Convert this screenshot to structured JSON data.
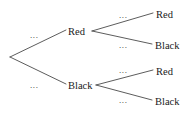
{
  "diagram": {
    "type": "probability-tree",
    "title": "",
    "stroke_color": "#4a4a4a",
    "text_color": "#1a1a1a",
    "background": "#ffffff",
    "root": {
      "label": "",
      "x": 10,
      "y": 57
    },
    "nodes": [
      {
        "id": "level1-red",
        "label": "Red",
        "level": 1,
        "x": 68,
        "y": 26
      },
      {
        "id": "level1-black",
        "label": "Black",
        "level": 1,
        "x": 68,
        "y": 80
      },
      {
        "id": "level2-red-red",
        "label": "Red",
        "level": 2,
        "x": 156,
        "y": 9
      },
      {
        "id": "level2-red-black",
        "label": "Black",
        "level": 2,
        "x": 155,
        "y": 40
      },
      {
        "id": "level2-black-red",
        "label": "Red",
        "level": 2,
        "x": 156,
        "y": 66
      },
      {
        "id": "level2-black-black",
        "label": "Black",
        "level": 2,
        "x": 155,
        "y": 96
      }
    ],
    "edge_labels": [
      {
        "id": "edge-root-red",
        "text": "...",
        "x": 30,
        "y": 31
      },
      {
        "id": "edge-root-black",
        "text": "...",
        "x": 30,
        "y": 81
      },
      {
        "id": "edge-red-red",
        "text": "...",
        "x": 119,
        "y": 11
      },
      {
        "id": "edge-red-black",
        "text": "...",
        "x": 119,
        "y": 41
      },
      {
        "id": "edge-black-red",
        "text": "...",
        "x": 119,
        "y": 66
      },
      {
        "id": "edge-black-black",
        "text": "...",
        "x": 119,
        "y": 96
      }
    ],
    "edges": [
      {
        "id": "root-to-red",
        "from": "root",
        "to": "level1-red",
        "path": "M 10 57 L 66 30"
      },
      {
        "id": "root-to-black",
        "from": "root",
        "to": "level1-black",
        "path": "M 10 57 L 66 84"
      },
      {
        "id": "red-to-red",
        "from": "level1-red",
        "to": "level2-red-red",
        "path": "M 92 31 L 153 13"
      },
      {
        "id": "red-to-black",
        "from": "level1-red",
        "to": "level2-red-black",
        "path": "M 92 31 L 152 44"
      },
      {
        "id": "black-to-red",
        "from": "level1-black",
        "to": "level2-black-red",
        "path": "M 96 85 L 153 70"
      },
      {
        "id": "black-to-black",
        "from": "level1-black",
        "to": "level2-black-black",
        "path": "M 96 85 L 152 100"
      }
    ]
  }
}
